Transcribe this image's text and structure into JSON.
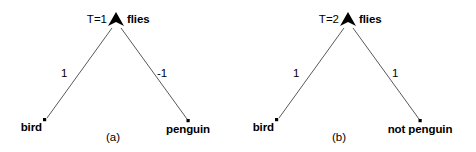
{
  "figure": {
    "width": 476,
    "height": 152,
    "background_color": "#ffffff",
    "ink_color": "#000000",
    "edge_color": "#595959"
  },
  "panels": [
    {
      "id": "a",
      "caption": "(a)",
      "caption_pos": {
        "x": 113,
        "y": 132
      },
      "root": {
        "label": "flies",
        "tag": "T=1",
        "marker": "filled-triangle",
        "pos": {
          "x": 116,
          "y": 21
        },
        "tag_pos": {
          "x": 107,
          "y": 14
        },
        "label_pos": {
          "x": 127,
          "y": 14
        }
      },
      "leaves": [
        {
          "label": "bird",
          "marker": "square-dot",
          "pos": {
            "x": 45,
            "y": 120
          },
          "label_pos": {
            "x": 42,
            "y": 122
          },
          "label_align": "end"
        },
        {
          "label": "penguin",
          "marker": "square-dot",
          "pos": {
            "x": 188,
            "y": 121
          },
          "label_pos": {
            "x": 188,
            "y": 124
          },
          "label_align": "mid"
        }
      ],
      "edges": [
        {
          "from": "flies",
          "to": "bird",
          "weight": "1",
          "weight_pos": {
            "x": 61,
            "y": 68
          }
        },
        {
          "from": "flies",
          "to": "penguin",
          "weight": "-1",
          "weight_pos": {
            "x": 157,
            "y": 68
          }
        }
      ]
    },
    {
      "id": "b",
      "caption": "(b)",
      "caption_pos": {
        "x": 339,
        "y": 132
      },
      "root": {
        "label": "flies",
        "tag": "T=2",
        "marker": "filled-triangle",
        "pos": {
          "x": 348,
          "y": 21
        },
        "tag_pos": {
          "x": 339,
          "y": 14
        },
        "label_pos": {
          "x": 359,
          "y": 14
        }
      },
      "leaves": [
        {
          "label": "bird",
          "marker": "square-dot",
          "pos": {
            "x": 277,
            "y": 120
          },
          "label_pos": {
            "x": 274,
            "y": 122
          },
          "label_align": "end"
        },
        {
          "label": "not penguin",
          "marker": "square-dot",
          "pos": {
            "x": 420,
            "y": 121
          },
          "label_pos": {
            "x": 420,
            "y": 124
          },
          "label_align": "mid"
        }
      ],
      "edges": [
        {
          "from": "flies",
          "to": "bird",
          "weight": "1",
          "weight_pos": {
            "x": 293,
            "y": 68
          }
        },
        {
          "from": "flies",
          "to": "not penguin",
          "weight": "1",
          "weight_pos": {
            "x": 392,
            "y": 68
          }
        }
      ]
    }
  ]
}
